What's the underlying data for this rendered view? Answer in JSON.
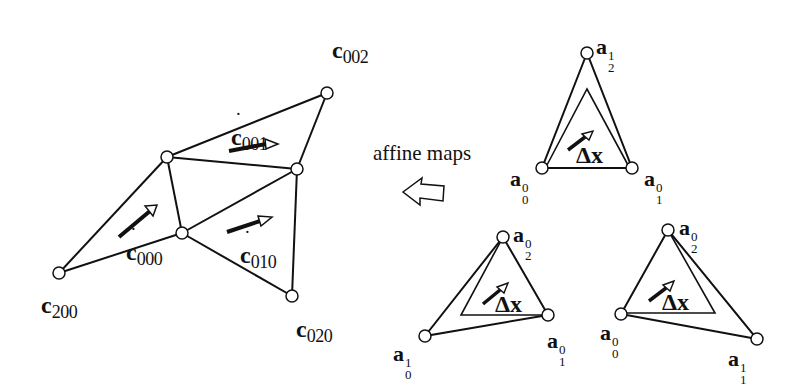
{
  "diagram": {
    "caption": "affine maps",
    "mesh": {
      "labels": {
        "c002": {
          "base": "c",
          "sub": "002"
        },
        "c200": {
          "base": "c",
          "sub": "200"
        },
        "c020": {
          "base": "c",
          "sub": "020"
        },
        "cdot001": {
          "base": "c",
          "sub": "001",
          "dot": "˙"
        },
        "cdot000": {
          "base": "c",
          "sub": "000",
          "dot": "˙"
        },
        "cdot010": {
          "base": "c",
          "sub": "010",
          "dot": "˙"
        }
      }
    },
    "triangles": [
      {
        "name": "top",
        "labels": [
          {
            "base": "a",
            "sub": "2",
            "sup": "1"
          },
          {
            "base": "a",
            "sub": "0",
            "sup": "0"
          },
          {
            "base": "a",
            "sub": "1",
            "sup": "0"
          }
        ],
        "delta": "Δx"
      },
      {
        "name": "bottom-middle",
        "labels": [
          {
            "base": "a",
            "sub": "2",
            "sup": "0"
          },
          {
            "base": "a",
            "sub": "0",
            "sup": "1"
          },
          {
            "base": "a",
            "sub": "1",
            "sup": "0"
          }
        ],
        "delta": "Δx"
      },
      {
        "name": "bottom-right",
        "labels": [
          {
            "base": "a",
            "sub": "2",
            "sup": "0"
          },
          {
            "base": "a",
            "sub": "0",
            "sup": "0"
          },
          {
            "base": "a",
            "sub": "1",
            "sup": "1"
          }
        ],
        "delta": "Δx"
      }
    ],
    "colors": {
      "stroke": "#111111",
      "background": "#ffffff"
    }
  }
}
